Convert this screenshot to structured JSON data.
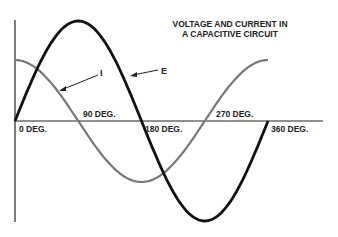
{
  "title_line1": "VOLTAGE AND CURRENT IN",
  "title_line2": "A CAPACITIVE CIRCUIT",
  "labels": {
    "current": "I",
    "voltage": "E"
  },
  "ticks": [
    "0 DEG.",
    "90 DEG.",
    "180 DEG.",
    "270 DEG.",
    "360 DEG."
  ],
  "chart_data": {
    "type": "line",
    "title": "Voltage and Current in a Capacitive Circuit",
    "xlabel": "Phase (degrees)",
    "ylabel": "",
    "x": [
      0,
      90,
      180,
      270,
      360
    ],
    "series": [
      {
        "name": "E",
        "values": [
          0,
          1,
          0,
          -1,
          0
        ],
        "color": "#111111"
      },
      {
        "name": "I",
        "values": [
          0.6,
          0,
          -0.6,
          0,
          0.6
        ],
        "color": "#777777"
      }
    ]
  }
}
